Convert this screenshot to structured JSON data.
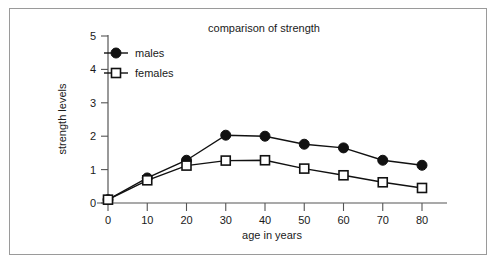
{
  "chart_data": {
    "type": "line",
    "title": "comparison of strength",
    "xlabel": "age in years",
    "ylabel": "strength levels",
    "x": [
      0,
      10,
      20,
      30,
      40,
      50,
      60,
      70,
      80
    ],
    "xticks": [
      "0",
      "10",
      "20",
      "30",
      "40",
      "50",
      "60",
      "70",
      "80"
    ],
    "yticks": [
      "0",
      "1",
      "2",
      "3",
      "4",
      "5"
    ],
    "xlim": [
      0,
      80
    ],
    "ylim": [
      0,
      5
    ],
    "grid": false,
    "legend_position": "top-left",
    "series": [
      {
        "name": "males",
        "marker": "filled-circle",
        "color": "#111111",
        "values": [
          0.1,
          0.75,
          1.28,
          2.03,
          2.0,
          1.76,
          1.65,
          1.28,
          1.13
        ]
      },
      {
        "name": "females",
        "marker": "open-square",
        "color": "#111111",
        "values": [
          0.1,
          0.68,
          1.12,
          1.27,
          1.28,
          1.03,
          0.83,
          0.62,
          0.45
        ]
      }
    ]
  },
  "frame": {
    "border_color": "#9a9a9a",
    "background": "#ffffff"
  }
}
